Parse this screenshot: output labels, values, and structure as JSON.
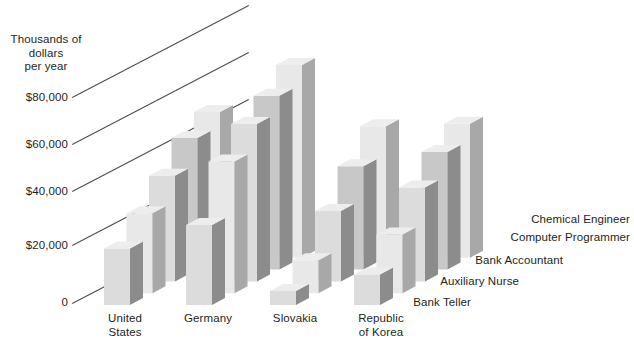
{
  "axis": {
    "y_title": "Thousands of\ndollars\nper year",
    "y_ticks": [
      "$80,000",
      "$60,000",
      "$40,000",
      "$20,000",
      "0"
    ],
    "y_tick_values": [
      80000,
      60000,
      40000,
      20000,
      0
    ]
  },
  "series_labels": [
    "Chemical Engineer",
    "Computer Programmer",
    "Bank Accountant",
    "Auxiliary Nurse",
    "Bank Teller"
  ],
  "category_labels": [
    "United\nStates",
    "Germany",
    "Slovakia",
    "Republic\nof Korea"
  ],
  "colors": {
    "front_light": "#dcdcdc",
    "front_mid": "#c8c8c8",
    "front_pale": "#e8e8e8",
    "side_dark": "#8c8c8c",
    "side_mid": "#a8a8a8",
    "top_light": "#ededed",
    "axis": "#4a4a4a",
    "text": "#231f20"
  },
  "chart_data": {
    "type": "bar",
    "title": "",
    "subtitle": "",
    "xlabel": "",
    "ylabel": "Thousands of dollars per year",
    "ylim": [
      0,
      90000
    ],
    "yticks": [
      0,
      20000,
      40000,
      60000,
      80000
    ],
    "grid": true,
    "legend": "right-inline-3d",
    "projection": "3d-grouped-bars",
    "categories": [
      "United States",
      "Germany",
      "Slovakia",
      "Republic of Korea"
    ],
    "series": [
      {
        "name": "Bank Teller",
        "values": [
          24000,
          34000,
          6000,
          13000
        ]
      },
      {
        "name": "Auxiliary Nurse",
        "values": [
          34000,
          56000,
          14000,
          25000
        ]
      },
      {
        "name": "Bank Accountant",
        "values": [
          45000,
          67000,
          30000,
          40000
        ]
      },
      {
        "name": "Computer Programmer",
        "values": [
          56000,
          74000,
          44000,
          50000
        ]
      },
      {
        "name": "Chemical Engineer",
        "values": [
          62000,
          82000,
          56000,
          57000
        ]
      }
    ]
  }
}
